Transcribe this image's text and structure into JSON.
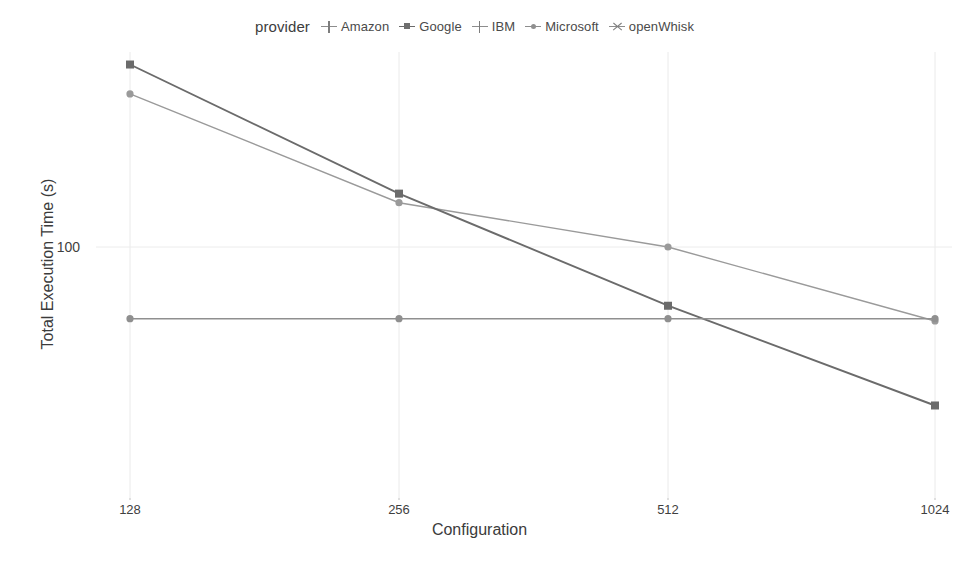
{
  "chart_data": {
    "type": "line",
    "title": "",
    "xlabel": "Configuration",
    "ylabel": "Total Execution Time (s)",
    "legend_title": "provider",
    "legend_position": "top-center",
    "grid": true,
    "yscale": "log",
    "xscale": "log2-categorical",
    "categories": [
      "128",
      "256",
      "512",
      "1024"
    ],
    "x": [
      128,
      256,
      512,
      1024
    ],
    "ytick_labels": [
      "100"
    ],
    "yticks": [
      100
    ],
    "xtick_labels": [
      "128",
      "256",
      "512",
      "1024"
    ],
    "ylim": [
      5,
      520
    ],
    "series": [
      {
        "name": "Amazon",
        "marker": "plus-dot",
        "color": "#9a9a9a",
        "values": [
          320,
          140,
          100,
          57
        ]
      },
      {
        "name": "Google",
        "marker": "square",
        "color": "#6b6b6b",
        "values": [
          400,
          150,
          64,
          30
        ]
      },
      {
        "name": "IBM",
        "marker": "plus",
        "color": "#6f6f6f",
        "values": [
          7.0,
          7.0,
          7.0,
          7.0
        ]
      },
      {
        "name": "Microsoft",
        "marker": "dot",
        "color": "#8f8f8f",
        "values": [
          58,
          58,
          58,
          58
        ]
      },
      {
        "name": "openWhisk",
        "marker": "cross",
        "color": "#6f6f6f",
        "values": [
          9.0,
          9.2,
          9.5,
          9.0
        ]
      }
    ]
  },
  "legend": {
    "title": "provider",
    "items": [
      {
        "label": "Amazon",
        "key": "plus-dot-icon"
      },
      {
        "label": "Google",
        "key": "square-icon"
      },
      {
        "label": "IBM",
        "key": "plus-icon"
      },
      {
        "label": "Microsoft",
        "key": "dot-icon"
      },
      {
        "label": "openWhisk",
        "key": "cross-icon"
      }
    ]
  },
  "axes": {
    "y_title": "Total Execution Time (s)",
    "x_title": "Configuration",
    "y_tick_100": "100",
    "x_tick_128": "128",
    "x_tick_256": "256",
    "x_tick_512": "512",
    "x_tick_1024": "1024"
  }
}
